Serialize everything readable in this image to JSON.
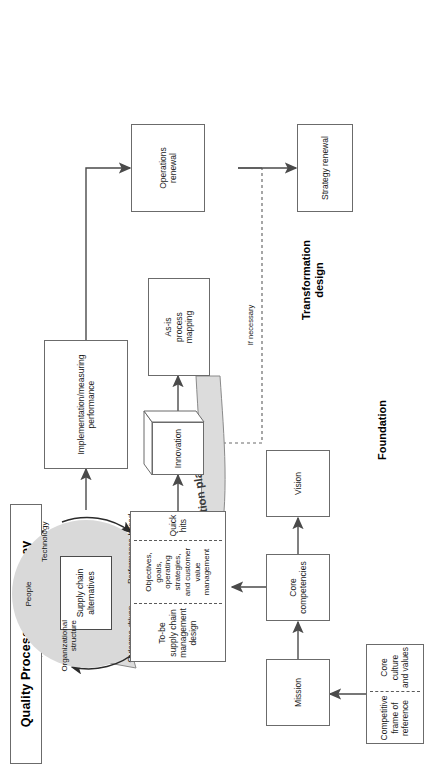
{
  "figure": {
    "title": "Quality Process—The Journey"
  },
  "sections": {
    "foundation": "Foundation",
    "transformation": "Transformation\ndesign",
    "transformation_line1": "Transformation",
    "transformation_line2": "design"
  },
  "foundation_boxes": {
    "competitive_frame": "Competitive\nframe of\nreference",
    "core_culture": "Core culture\nand values",
    "mission": "Mission",
    "core_competencies": "Core\ncompetencies",
    "vision": "Vision"
  },
  "transformation_panel": {
    "to_be": "To-be\nsupply chain\nmanagement\ndesign",
    "objectives": "Objectives,\ngoals,\noperating\nstrategies,\nand customer\nvalue\nmanagement",
    "quick_hits": "Quick hits"
  },
  "process_boxes": {
    "innovation": "Innovation",
    "as_is": "As-is\nprocess\nmapping",
    "implementation": "Implementation/measuring\nperformance",
    "operations_renewal": "Operations\nrenewal",
    "strategy_renewal": "Strategy renewal"
  },
  "arrows": {
    "migration_plan": "Migration plan",
    "if_necessary": "If necessary"
  },
  "cycle": {
    "center": "Supply chain\nalternatives",
    "nodes": [
      {
        "id": "people",
        "label": "People"
      },
      {
        "id": "technology",
        "label": "Technology"
      },
      {
        "id": "performance_rewards",
        "label": "Performance-based\nrewards"
      },
      {
        "id": "outcome_driven",
        "label": "Outcome-driven\ntask/process\ndefinition"
      },
      {
        "id": "organizational_structure",
        "label": "Organizational\nstructure"
      }
    ],
    "node_people": "People",
    "node_technology": "Technology",
    "node_rewards": "Performance-based\nrewards",
    "node_outcome": "Outcome-driven\ntask/process\ndefinition",
    "node_org": "Organizational\nstructure"
  },
  "colors": {
    "disc_fill": "#d9d9d9",
    "line": "#6b6b6b",
    "text": "#1a1a1a",
    "migration_fill": "#dcdcdc"
  }
}
